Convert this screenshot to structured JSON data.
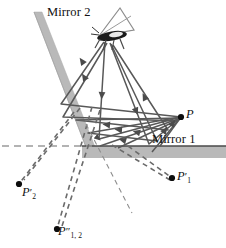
{
  "figure": {
    "type": "optics-ray-diagram",
    "width": 226,
    "height": 248,
    "background_color": "#ffffff"
  },
  "labels": {
    "mirror2": "Mirror 2",
    "mirror1": "Mirror 1",
    "object_point": "P",
    "image_1": "P",
    "image_1_prime": "′",
    "image_1_sub": "1",
    "image_2": "P",
    "image_2_prime": "′",
    "image_2_sub": "2",
    "image_12": "P",
    "image_12_prime": "″",
    "image_12_sub": "1, 2"
  },
  "colors": {
    "mirror_band": "#b9b9b9",
    "mirror_band_edge": "#a3a3a3",
    "mirror1_surface_line": "#4a4a4a",
    "ray_line": "#585858",
    "ray_line_dark": "#4b4b4b",
    "dashed_line": "#6b6b6b",
    "axis_dashed": "#9a9a9a",
    "point_dot": "#0d0d0d",
    "text": "#111111",
    "insect_body": "#1a1a1a",
    "insect_wing": "#8a8a8a"
  },
  "geometry": {
    "mirror1": {
      "name": "horizontal-mirror",
      "x_start": 82,
      "x_end": 226,
      "surface_y": 146,
      "band_thickness": 12
    },
    "mirror2": {
      "name": "tilted-mirror",
      "top_x": 38,
      "top_y": 14,
      "bottom_x": 92,
      "bottom_y": 154,
      "band_thickness": 9
    },
    "optical_axis_dashed": {
      "y": 146,
      "x_start": 2,
      "x_end": 92
    },
    "points": {
      "P": {
        "x": 181,
        "y": 117
      },
      "P1": {
        "x": 172,
        "y": 178
      },
      "P2": {
        "x": 19,
        "y": 184
      },
      "P12": {
        "x": 57,
        "y": 229
      },
      "source": {
        "x": 106,
        "y": 42
      }
    }
  },
  "ray_paths": [
    {
      "name": "ray-a",
      "points": [
        [
          106,
          42
        ],
        [
          100,
          138
        ],
        [
          181,
          117
        ]
      ]
    },
    {
      "name": "ray-b",
      "points": [
        [
          109,
          43
        ],
        [
          147,
          143
        ],
        [
          181,
          117
        ]
      ]
    },
    {
      "name": "ray-c",
      "points": [
        [
          104,
          42
        ],
        [
          62,
          105
        ],
        [
          181,
          117
        ]
      ]
    },
    {
      "name": "ray-d",
      "points": [
        [
          108,
          43
        ],
        [
          63,
          116
        ],
        [
          176,
          122
        ]
      ]
    },
    {
      "name": "ray-e",
      "points": [
        [
          110,
          44
        ],
        [
          156,
          140
        ],
        [
          112,
          135
        ],
        [
          181,
          117
        ]
      ]
    },
    {
      "name": "ray-f",
      "points": [
        [
          112,
          44
        ],
        [
          167,
          131
        ],
        [
          100,
          146
        ],
        [
          181,
          118
        ]
      ]
    }
  ],
  "virtual_paths": [
    {
      "name": "virtual-to-P1",
      "from": [
        145,
        146
      ],
      "to": [
        172,
        178
      ]
    },
    {
      "name": "virtual-to-P1-b",
      "from": [
        120,
        147
      ],
      "to": [
        172,
        178
      ]
    },
    {
      "name": "virtual-to-P2",
      "from": [
        72,
        120
      ],
      "to": [
        19,
        184
      ]
    },
    {
      "name": "virtual-to-P2-b",
      "from": [
        78,
        115
      ],
      "to": [
        22,
        181
      ]
    },
    {
      "name": "virtual-to-P12",
      "from": [
        92,
        112
      ],
      "to": [
        57,
        229
      ]
    },
    {
      "name": "virtual-to-P12-b",
      "from": [
        99,
        115
      ],
      "to": [
        61,
        226
      ]
    },
    {
      "name": "virtual-extension",
      "from": [
        88,
        128
      ],
      "to": [
        130,
        212
      ]
    }
  ]
}
